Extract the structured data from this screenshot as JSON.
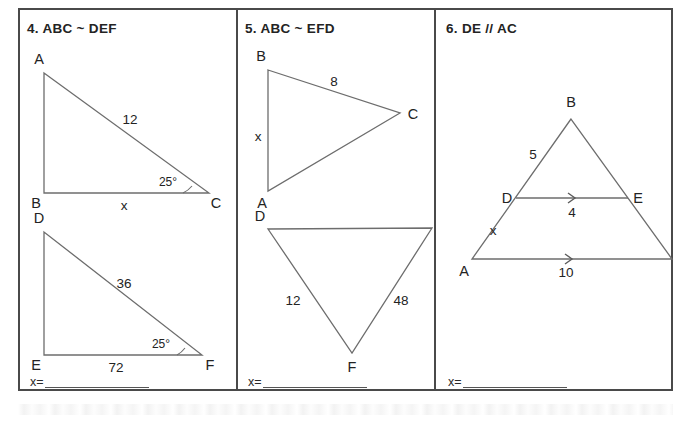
{
  "worksheet": {
    "panels": [
      {
        "number": "4.",
        "title": "4.  ABC ~ DEF",
        "answer_prefix": "x=",
        "figures": [
          {
            "name": "triangle-abc",
            "vertices": [
              {
                "label": "A",
                "x": 42,
                "y": 63
              },
              {
                "label": "B",
                "x": 42,
                "y": 183
              },
              {
                "label": "C",
                "x": 207,
                "y": 183
              }
            ],
            "side_labels": [
              {
                "text": "12",
                "x": 128,
                "y": 109
              },
              {
                "text": "x",
                "x": 122,
                "y": 198
              }
            ],
            "angle_labels": [
              {
                "text": "25°",
                "x": 166,
                "y": 178
              }
            ]
          },
          {
            "name": "triangle-def",
            "vertices": [
              {
                "label": "D",
                "x": 42,
                "y": 222
              },
              {
                "label": "E",
                "x": 42,
                "y": 345
              },
              {
                "label": "F",
                "x": 200,
                "y": 345
              }
            ],
            "side_labels": [
              {
                "text": "36",
                "x": 122,
                "y": 273
              },
              {
                "text": "72",
                "x": 114,
                "y": 360
              }
            ],
            "angle_labels": [
              {
                "text": "25°",
                "x": 158,
                "y": 340
              }
            ]
          }
        ]
      },
      {
        "number": "5.",
        "title": "5.  ABC ~ EFD",
        "answer_prefix": "x=",
        "figures": [
          {
            "name": "triangle-abc",
            "vertices": [
              {
                "label": "B",
                "x": 266,
                "y": 60
              },
              {
                "label": "C",
                "x": 398,
                "y": 103
              },
              {
                "label": "A",
                "x": 266,
                "y": 181
              }
            ],
            "side_labels": [
              {
                "text": "8",
                "x": 330,
                "y": 72
              },
              {
                "text": "x",
                "x": 256,
                "y": 126
              }
            ],
            "angle_labels": []
          },
          {
            "name": "triangle-def",
            "vertices": [
              {
                "label": "D",
                "x": 266,
                "y": 219
              },
              {
                "label": "E",
                "x": 430,
                "y": 218
              },
              {
                "label": "F",
                "x": 350,
                "y": 343
              }
            ],
            "side_labels": [
              {
                "text": "12",
                "x": 291,
                "y": 290
              },
              {
                "text": "48",
                "x": 399,
                "y": 290
              }
            ],
            "angle_labels": []
          }
        ]
      },
      {
        "number": "6.",
        "title": "6. DE // AC",
        "answer_prefix": "x=",
        "figures": [
          {
            "name": "triangle-abc-with-parallel-segment",
            "vertices": [
              {
                "label": "B",
                "x": 565,
                "y": 117
              },
              {
                "label": "A",
                "x": 470,
                "y": 257
              },
              {
                "label": "C",
                "x": 654,
                "y": 257
              },
              {
                "label": "D",
                "x": 512,
                "y": 196
              },
              {
                "label": "E",
                "x": 618,
                "y": 196
              }
            ],
            "side_labels": [
              {
                "text": "5",
                "x": 527,
                "y": 153
              },
              {
                "text": "4",
                "x": 566,
                "y": 211
              },
              {
                "text": "x",
                "x": 490,
                "y": 228
              },
              {
                "text": "10",
                "x": 560,
                "y": 271
              }
            ],
            "angle_labels": []
          }
        ]
      }
    ]
  },
  "colors": {
    "border": "#4a4a4a",
    "figure_stroke": "#6d6d6d",
    "text": "#232323"
  }
}
